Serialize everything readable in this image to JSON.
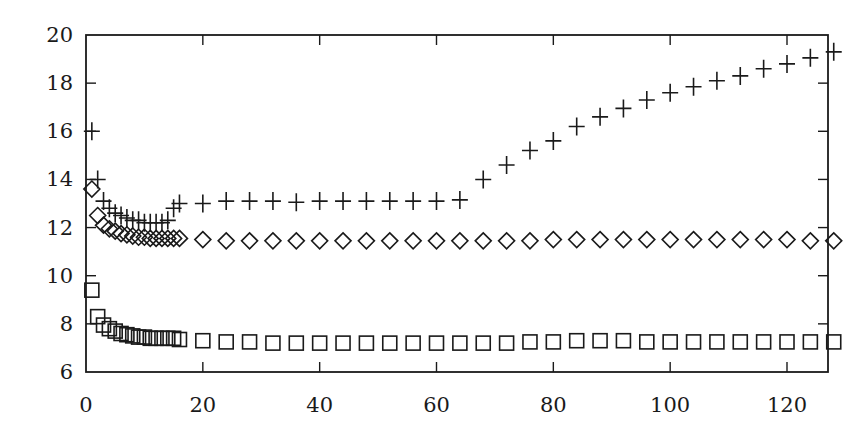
{
  "chart_data": {
    "type": "scatter",
    "title": "",
    "xlabel": "",
    "ylabel": "",
    "xlim": [
      0,
      129
    ],
    "ylim": [
      6,
      20
    ],
    "grid": false,
    "legend": null,
    "x_ticks": [
      0,
      20,
      40,
      60,
      80,
      100,
      120
    ],
    "y_ticks": [
      6,
      8,
      10,
      12,
      14,
      16,
      18,
      20
    ],
    "x": [
      1,
      2,
      3,
      4,
      5,
      6,
      7,
      8,
      9,
      10,
      11,
      12,
      13,
      14,
      15,
      16,
      20,
      24,
      28,
      32,
      36,
      40,
      44,
      48,
      52,
      56,
      60,
      64,
      68,
      72,
      76,
      80,
      84,
      88,
      92,
      96,
      100,
      104,
      108,
      112,
      116,
      120,
      124,
      128
    ],
    "series": [
      {
        "name": "plus",
        "marker": "plus",
        "values": [
          16.0,
          14.0,
          13.1,
          12.8,
          12.6,
          12.5,
          12.4,
          12.3,
          12.3,
          12.2,
          12.2,
          12.2,
          12.2,
          12.3,
          12.8,
          13.0,
          13.0,
          13.1,
          13.1,
          13.1,
          13.05,
          13.1,
          13.1,
          13.1,
          13.1,
          13.1,
          13.1,
          13.15,
          14.0,
          14.6,
          15.2,
          15.6,
          16.2,
          16.6,
          16.95,
          17.3,
          17.6,
          17.85,
          18.1,
          18.3,
          18.6,
          18.8,
          19.05,
          19.3
        ]
      },
      {
        "name": "diamond",
        "marker": "diamond",
        "values": [
          13.6,
          12.5,
          12.1,
          11.95,
          11.85,
          11.75,
          11.7,
          11.65,
          11.6,
          11.6,
          11.55,
          11.55,
          11.55,
          11.55,
          11.55,
          11.55,
          11.5,
          11.45,
          11.45,
          11.45,
          11.45,
          11.45,
          11.45,
          11.45,
          11.45,
          11.45,
          11.45,
          11.45,
          11.45,
          11.45,
          11.45,
          11.5,
          11.5,
          11.5,
          11.5,
          11.5,
          11.5,
          11.5,
          11.5,
          11.5,
          11.5,
          11.5,
          11.45,
          11.45
        ]
      },
      {
        "name": "square",
        "marker": "square",
        "values": [
          9.4,
          8.3,
          7.95,
          7.8,
          7.7,
          7.6,
          7.55,
          7.5,
          7.45,
          7.45,
          7.4,
          7.4,
          7.4,
          7.4,
          7.4,
          7.35,
          7.3,
          7.25,
          7.25,
          7.2,
          7.2,
          7.2,
          7.2,
          7.2,
          7.2,
          7.2,
          7.2,
          7.2,
          7.2,
          7.2,
          7.25,
          7.25,
          7.3,
          7.3,
          7.3,
          7.25,
          7.25,
          7.25,
          7.25,
          7.25,
          7.25,
          7.25,
          7.25,
          7.25
        ]
      }
    ]
  },
  "axes": {
    "x_tick_labels": [
      "0",
      "20",
      "40",
      "60",
      "80",
      "100",
      "120"
    ],
    "y_tick_labels": [
      "6",
      "8",
      "10",
      "12",
      "14",
      "16",
      "18",
      "20"
    ]
  },
  "colors": {
    "ink": "#1a1a1a",
    "background": "#ffffff"
  }
}
